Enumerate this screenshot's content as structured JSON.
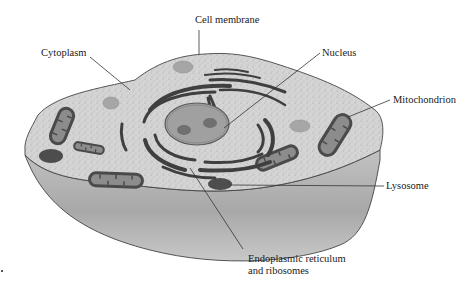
{
  "figure": {
    "colors": {
      "cytoplasm": "#d2d2d2",
      "side_wall": "#b8b8b8",
      "outline": "#444444",
      "organelle_dark": "#4a4a4a",
      "organelle_inner": "#8a8a8a",
      "nucleus": "#9a9a9a",
      "vesicle": "#a8a8a8"
    }
  },
  "labels": {
    "cell_membrane": "Cell membrane",
    "cytoplasm": "Cytoplasm",
    "nucleus": "Nucleus",
    "mitochondrion": "Mitochondrion",
    "lysosome": "Lysosome",
    "er_line1": "Endoplasmic reticulum",
    "er_line2": "and ribosomes"
  }
}
